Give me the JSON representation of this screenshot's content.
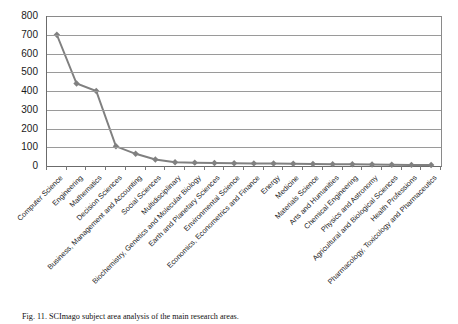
{
  "chart_data": {
    "type": "line",
    "title": "",
    "xlabel": "",
    "ylabel": "",
    "ylim": [
      0,
      800
    ],
    "yticks": [
      0,
      100,
      200,
      300,
      400,
      500,
      600,
      700,
      800
    ],
    "grid": "horizontal",
    "legend": "none",
    "marker": "diamond",
    "series_color": "#808080",
    "categories": [
      "Computer Science",
      "Engineering",
      "Mathematics",
      "Decision Sciences",
      "Business, Management and Accounting",
      "Social Sciences",
      "Multidisciplinary",
      "Biochemistry, Genetics and Molecular Biology",
      "Earth and Planetary Sciences",
      "Environmental Science",
      "Economics, Econometrics and Finance",
      "Energy",
      "Medicine",
      "Materials Science",
      "Arts and Humanities",
      "Chemical Engineering",
      "Physics and Astronomy",
      "Agricultural and Biological Sciences",
      "Health Professions",
      "Pharmacology, Toxicology and Pharmaceutics"
    ],
    "values": [
      700,
      440,
      400,
      105,
      65,
      35,
      20,
      18,
      16,
      15,
      14,
      13,
      12,
      11,
      10,
      9,
      8,
      7,
      6,
      5
    ]
  },
  "caption": {
    "figure_label": "Fig. 11.",
    "text": "Fig. 11. SCImago subject area analysis of the main research areas."
  }
}
